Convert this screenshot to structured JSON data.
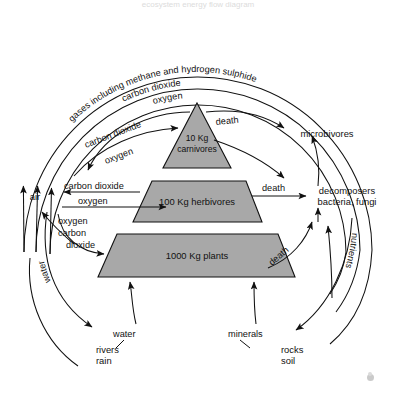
{
  "page": {
    "clipped_header_text": "ecosystem energy flow diagram",
    "background": "#ffffff",
    "block_fill": "#a8a8a8",
    "stroke": "#111111"
  },
  "arcs": {
    "outer_label": "gases including methane and hydrogen sulphide",
    "middle_label": "carbon dioxide",
    "inner_label": "oxygen",
    "left_label": "water",
    "right_label": "nutrients"
  },
  "blocks": [
    {
      "name": "carnivores",
      "amount": "10 Kg",
      "label": "carnivores",
      "shape": "triangle"
    },
    {
      "name": "herbivores",
      "text": "100 Kg herbivores",
      "shape": "trapezoid"
    },
    {
      "name": "plants",
      "text": "1000 Kg  plants",
      "shape": "trapezoid"
    }
  ],
  "compartments": {
    "air": "air",
    "microbivores": "microbivores",
    "decomposers_line1": "decomposers",
    "decomposers_line2": "bacteria, fungi",
    "rivers_line1": "rivers",
    "rivers_line2": "rain",
    "rocks_line1": "rocks",
    "rocks_line2": "soil"
  },
  "flows": {
    "carnivore_co2": "carbon dioxide",
    "carnivore_o2": "oxygen",
    "herbivore_co2": "carbon dioxide",
    "herbivore_o2": "oxygen",
    "plants_o2": "oxygen",
    "plants_carbon": "carbon",
    "plants_dioxide": "dioxide",
    "death_carnivores": "death",
    "death_herbivores": "death",
    "death_plants": "death",
    "water_uptake": "water",
    "minerals_uptake": "minerals"
  }
}
